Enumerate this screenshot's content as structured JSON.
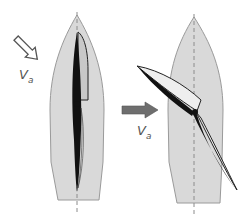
{
  "diagram": {
    "colors": {
      "hull_fill": "#d9d9d9",
      "hull_stroke": "#9a9a9a",
      "centerline": "#8c8c8c",
      "sail_dark": "#111111",
      "sail_light": "#f2f2f2",
      "arrow_outline": "#555555",
      "arrow_filled": "#6e6e6e"
    },
    "left_panel": {
      "wind_label_main": "V",
      "wind_label_sub": "a",
      "wind_arrow": "hollow-diagonal-arrow"
    },
    "right_panel": {
      "wind_label_main": "V",
      "wind_label_sub": "a",
      "wind_arrow": "filled-horizontal-arrow"
    }
  }
}
